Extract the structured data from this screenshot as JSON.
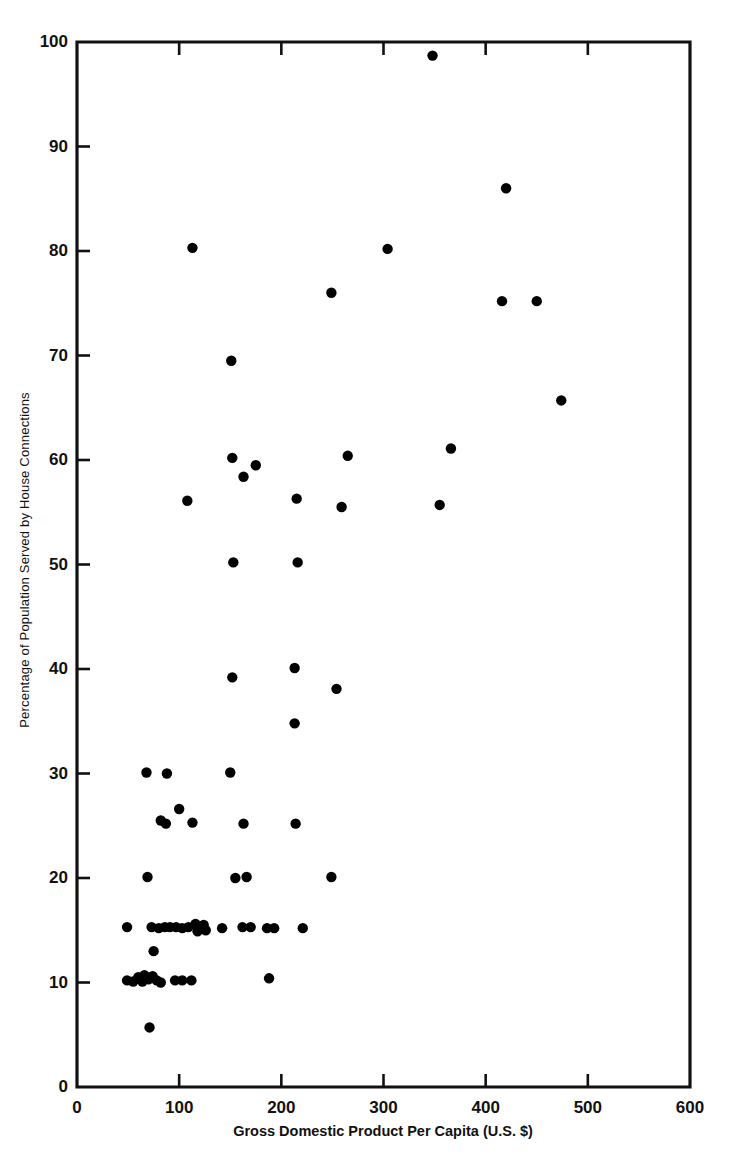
{
  "chart_data": {
    "type": "scatter",
    "title": "",
    "xlabel": "Gross Domestic Product Per Capita (U.S. $)",
    "ylabel": "Percentage of Population Served by House Connections",
    "xlim": [
      0,
      600
    ],
    "ylim": [
      0,
      100
    ],
    "xticks": [
      0,
      100,
      200,
      300,
      400,
      500,
      600
    ],
    "yticks": [
      0,
      10,
      20,
      30,
      40,
      50,
      60,
      70,
      80,
      90,
      100
    ],
    "xticklabels": [
      "0",
      "100",
      "200",
      "300",
      "400",
      "500",
      "600"
    ],
    "yticklabels": [
      "0",
      "10",
      "20",
      "30",
      "40",
      "50",
      "60",
      "70",
      "80",
      "90",
      "100"
    ],
    "grid": false,
    "legend": null,
    "marker": {
      "shape": "circle",
      "color": "#000000",
      "size": 5.2
    },
    "points": [
      [
        348,
        98.7
      ],
      [
        420,
        86.0
      ],
      [
        113,
        80.3
      ],
      [
        304,
        80.2
      ],
      [
        249,
        76.0
      ],
      [
        416,
        75.2
      ],
      [
        450,
        75.2
      ],
      [
        151,
        69.5
      ],
      [
        474,
        65.7
      ],
      [
        366,
        61.1
      ],
      [
        265,
        60.4
      ],
      [
        152,
        60.2
      ],
      [
        175,
        59.5
      ],
      [
        163,
        58.4
      ],
      [
        215,
        56.3
      ],
      [
        108,
        56.1
      ],
      [
        259,
        55.5
      ],
      [
        355,
        55.7
      ],
      [
        153,
        50.2
      ],
      [
        216,
        50.2
      ],
      [
        213,
        40.1
      ],
      [
        254,
        38.1
      ],
      [
        152,
        39.2
      ],
      [
        213,
        34.8
      ],
      [
        68,
        30.1
      ],
      [
        88,
        30.0
      ],
      [
        150,
        30.1
      ],
      [
        100,
        26.6
      ],
      [
        82,
        25.5
      ],
      [
        87,
        25.2
      ],
      [
        113,
        25.3
      ],
      [
        163,
        25.2
      ],
      [
        214,
        25.2
      ],
      [
        69,
        20.1
      ],
      [
        155,
        20.0
      ],
      [
        166,
        20.1
      ],
      [
        249,
        20.1
      ],
      [
        49,
        15.3
      ],
      [
        73,
        15.3
      ],
      [
        80,
        15.2
      ],
      [
        86,
        15.3
      ],
      [
        91,
        15.3
      ],
      [
        97,
        15.3
      ],
      [
        103,
        15.2
      ],
      [
        109,
        15.3
      ],
      [
        116,
        15.6
      ],
      [
        118,
        14.9
      ],
      [
        124,
        15.5
      ],
      [
        126,
        15.0
      ],
      [
        142,
        15.2
      ],
      [
        162,
        15.3
      ],
      [
        170,
        15.3
      ],
      [
        186,
        15.2
      ],
      [
        193,
        15.2
      ],
      [
        221,
        15.2
      ],
      [
        75,
        13.0
      ],
      [
        49,
        10.2
      ],
      [
        55,
        10.1
      ],
      [
        60,
        10.5
      ],
      [
        64,
        10.1
      ],
      [
        66,
        10.7
      ],
      [
        70,
        10.3
      ],
      [
        74,
        10.6
      ],
      [
        78,
        10.2
      ],
      [
        82,
        10.0
      ],
      [
        96,
        10.2
      ],
      [
        103,
        10.2
      ],
      [
        112,
        10.2
      ],
      [
        188,
        10.4
      ],
      [
        71,
        5.7
      ]
    ]
  },
  "axes": {
    "x_axis_name": "gdp-per-capita-axis",
    "y_axis_name": "percentage-served-axis"
  }
}
